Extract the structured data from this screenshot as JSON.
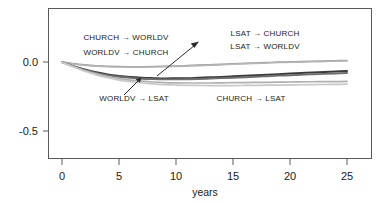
{
  "chart_data": {
    "type": "line",
    "title": "",
    "xlabel": "years",
    "ylabel": "",
    "xlim": [
      -0.5,
      26
    ],
    "ylim": [
      -0.72,
      0.15
    ],
    "xticks": [
      0,
      5,
      10,
      15,
      20,
      25
    ],
    "xtick_labels": [
      "0",
      "5",
      "10",
      "15",
      "20",
      "25"
    ],
    "yticks": [
      0.0,
      -0.5
    ],
    "ytick_labels": [
      "0.0",
      "-0.5"
    ],
    "grid": false,
    "legend": "none (in-plot annotations)",
    "x": [
      0,
      1,
      2,
      3,
      4,
      5,
      6,
      7,
      8,
      9,
      10,
      11,
      12,
      13,
      14,
      15,
      16,
      17,
      18,
      19,
      20,
      21,
      22,
      23,
      24,
      25
    ],
    "series": [
      {
        "name": "LSAT -> CHURCH",
        "color": "#9a9a9a",
        "values": [
          0.0,
          -0.012,
          -0.021,
          -0.027,
          -0.031,
          -0.033,
          -0.034,
          -0.034,
          -0.033,
          -0.031,
          -0.029,
          -0.026,
          -0.023,
          -0.02,
          -0.017,
          -0.013,
          -0.01,
          -0.007,
          -0.004,
          -0.001,
          0.001,
          0.003,
          0.005,
          0.007,
          0.009,
          0.011
        ]
      },
      {
        "name": "LSAT -> WORLDV",
        "color": "#b5b5b5",
        "values": [
          0.0,
          -0.014,
          -0.024,
          -0.03,
          -0.034,
          -0.036,
          -0.037,
          -0.037,
          -0.036,
          -0.034,
          -0.032,
          -0.029,
          -0.026,
          -0.023,
          -0.02,
          -0.016,
          -0.013,
          -0.01,
          -0.007,
          -0.004,
          -0.002,
          0.0,
          0.002,
          0.004,
          0.006,
          0.008
        ]
      },
      {
        "name": "CHURCH -> WORLDV",
        "color": "#3a3a3a",
        "values": [
          0.0,
          -0.03,
          -0.055,
          -0.075,
          -0.09,
          -0.101,
          -0.109,
          -0.114,
          -0.117,
          -0.119,
          -0.118,
          -0.117,
          -0.114,
          -0.111,
          -0.108,
          -0.104,
          -0.1,
          -0.096,
          -0.092,
          -0.088,
          -0.084,
          -0.08,
          -0.076,
          -0.073,
          -0.069,
          -0.066
        ]
      },
      {
        "name": "WORLDV -> CHURCH",
        "color": "#6e6e6e",
        "values": [
          0.0,
          -0.032,
          -0.058,
          -0.079,
          -0.095,
          -0.107,
          -0.115,
          -0.121,
          -0.124,
          -0.126,
          -0.126,
          -0.125,
          -0.123,
          -0.12,
          -0.117,
          -0.114,
          -0.11,
          -0.107,
          -0.103,
          -0.099,
          -0.096,
          -0.092,
          -0.089,
          -0.086,
          -0.083,
          -0.08
        ]
      },
      {
        "name": "WORLDV -> LSAT",
        "color": "#b0b0b0",
        "values": [
          0.0,
          -0.033,
          -0.062,
          -0.086,
          -0.105,
          -0.12,
          -0.131,
          -0.139,
          -0.145,
          -0.149,
          -0.151,
          -0.152,
          -0.152,
          -0.152,
          -0.151,
          -0.15,
          -0.149,
          -0.148,
          -0.147,
          -0.146,
          -0.145,
          -0.144,
          -0.143,
          -0.142,
          -0.142,
          -0.141
        ]
      },
      {
        "name": "CHURCH -> LSAT",
        "color": "#c8c8c8",
        "values": [
          0.0,
          -0.036,
          -0.067,
          -0.093,
          -0.114,
          -0.131,
          -0.143,
          -0.152,
          -0.159,
          -0.164,
          -0.167,
          -0.169,
          -0.17,
          -0.171,
          -0.171,
          -0.171,
          -0.17,
          -0.169,
          -0.168,
          -0.167,
          -0.166,
          -0.165,
          -0.164,
          -0.163,
          -0.162,
          -0.161
        ]
      }
    ],
    "annotations": [
      {
        "text": "CHURCH → WORLDV",
        "x_px": 126,
        "y_px": 37
      },
      {
        "text": "WORLDV → CHURCH",
        "x_px": 126,
        "y_px": 51
      },
      {
        "text": "LSAT → CHURCH",
        "x_px": 265,
        "y_px": 33
      },
      {
        "text": "LSAT → WORLDV",
        "x_px": 265,
        "y_px": 46
      },
      {
        "text": "WORLDV → LSAT",
        "x_px": 134,
        "y_px": 100
      },
      {
        "text": "CHURCH → LSAT",
        "x_px": 251,
        "y_px": 100
      }
    ]
  },
  "axis": {
    "x_title": "years",
    "x_tick_0": "0",
    "x_tick_1": "5",
    "x_tick_2": "10",
    "x_tick_3": "15",
    "x_tick_4": "20",
    "x_tick_5": "25",
    "y_tick_0": "0.0",
    "y_tick_1": "-0.5"
  },
  "labels": {
    "church_to_worldv": "CHURCH → WORLDV",
    "worldv_to_church": "WORLDV → CHURCH",
    "lsat_to_church": "LSAT → CHURCH",
    "lsat_to_worldv": "LSAT → WORLDV",
    "worldv_to_lsat": "WORLDV → LSAT",
    "church_to_lsat": "CHURCH → LSAT"
  },
  "colors": {
    "frame": "#5a5a5a",
    "text": "#1a1a1a",
    "background": "#ffffff"
  }
}
